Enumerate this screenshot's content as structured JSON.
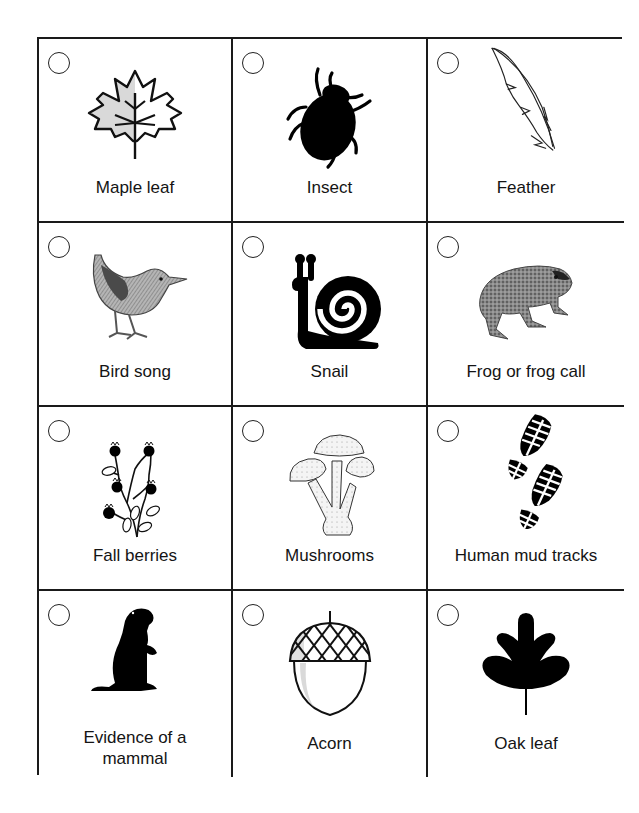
{
  "page": {
    "title_fragment": "g",
    "colors": {
      "border": "#1a1a1a",
      "ink": "#111111",
      "shade": "#d9d9d9",
      "background": "#ffffff"
    }
  },
  "grid": {
    "rows": 4,
    "columns": 3,
    "items": [
      {
        "label": "Maple leaf",
        "icon": "maple-leaf-icon",
        "checked": false
      },
      {
        "label": "Insect",
        "icon": "beetle-icon",
        "checked": false
      },
      {
        "label": "Feather",
        "icon": "feather-icon",
        "checked": false
      },
      {
        "label": "Bird song",
        "icon": "bird-icon",
        "checked": false
      },
      {
        "label": "Snail",
        "icon": "snail-icon",
        "checked": false
      },
      {
        "label": "Frog or frog call",
        "icon": "frog-icon",
        "checked": false
      },
      {
        "label": "Fall berries",
        "icon": "berries-icon",
        "checked": false
      },
      {
        "label": "Mushrooms",
        "icon": "mushrooms-icon",
        "checked": false
      },
      {
        "label": "Human mud tracks",
        "icon": "footprints-icon",
        "checked": false
      },
      {
        "label_line1": "Evidence of a",
        "label_line2": "mammal",
        "label": "Evidence of a mammal",
        "icon": "groundhog-icon",
        "checked": false
      },
      {
        "label": "Acorn",
        "icon": "acorn-icon",
        "checked": false
      },
      {
        "label": "Oak leaf",
        "icon": "oak-leaf-icon",
        "checked": false
      }
    ]
  }
}
